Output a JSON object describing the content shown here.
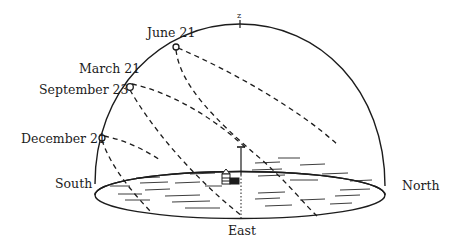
{
  "figure": {
    "zenith_label": "z",
    "dates": [
      {
        "label": "June 21"
      },
      {
        "label": "March 21"
      },
      {
        "label": "September 23"
      },
      {
        "label": "December 21"
      }
    ],
    "directions": {
      "south": "South",
      "north": "North",
      "east": "East"
    },
    "colors": {
      "ink": "#1c1c1c",
      "background": "#ffffff"
    }
  }
}
